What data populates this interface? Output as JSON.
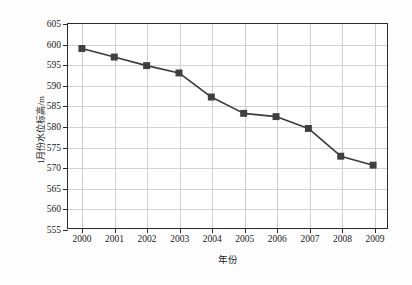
{
  "chart_data": {
    "type": "line",
    "title": "",
    "xlabel": "年份",
    "ylabel": "1月份水位标高/m",
    "categories": [
      "2000",
      "2001",
      "2002",
      "2003",
      "2004",
      "2005",
      "2006",
      "2007",
      "2008",
      "2009"
    ],
    "values": [
      599.0,
      596.9,
      594.8,
      593.0,
      587.1,
      583.1,
      582.3,
      579.4,
      572.6,
      570.4
    ],
    "series": [
      {
        "name": "1月份水位标高",
        "values": [
          599.0,
          596.9,
          594.8,
          593.0,
          587.1,
          583.1,
          582.3,
          579.4,
          572.6,
          570.4
        ]
      }
    ],
    "ylim": [
      555,
      605
    ],
    "yticks": [
      555,
      560,
      565,
      570,
      575,
      580,
      585,
      590,
      595,
      600,
      605
    ],
    "ytick_labels": [
      "555",
      "560",
      "565",
      "570",
      "575",
      "580",
      "585",
      "590",
      "595",
      "600",
      "605"
    ],
    "xtick_labels": [
      "2000",
      "2001",
      "2002",
      "2003",
      "2004",
      "2005",
      "2006",
      "2007",
      "2008",
      "2009"
    ],
    "grid": true,
    "grid_axis": "both",
    "legend": false,
    "marker": "square",
    "line_color": "#3a3a3a",
    "marker_color": "#3f3f3f",
    "grid_color": "#d2d2d2",
    "axis_color": "#2b2b2b",
    "background_color": "#ffffff"
  }
}
